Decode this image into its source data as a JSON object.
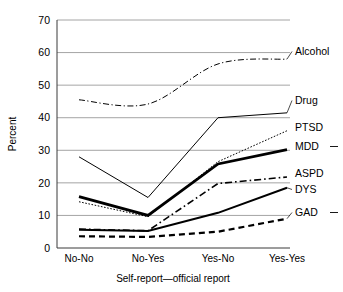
{
  "chart_data": {
    "type": "line",
    "title": "",
    "xlabel": "Self-report—official report",
    "ylabel": "Percent",
    "categories": [
      "No-No",
      "No-Yes",
      "Yes-No",
      "Yes-Yes"
    ],
    "ylim": [
      0,
      70
    ],
    "ytick_labels": [
      "0",
      "10",
      "20",
      "30",
      "40",
      "50",
      "60",
      "70"
    ],
    "yticks": [
      0,
      10,
      20,
      30,
      40,
      50,
      60,
      70
    ],
    "grid": "horizontal",
    "legend_position": "right-inline-at-line-end",
    "series": [
      {
        "name": "Alcohol",
        "values": [
          45.5,
          44.2,
          56.5,
          58.0
        ],
        "style": "dash-dot",
        "width": 1.0,
        "smooth": true
      },
      {
        "name": "Drug",
        "values": [
          28.0,
          15.5,
          40.0,
          41.5
        ],
        "style": "solid",
        "width": 1.0,
        "smooth": false
      },
      {
        "name": "PTSD",
        "values": [
          14.2,
          9.6,
          26.5,
          36.0
        ],
        "style": "dotted",
        "width": 1.0,
        "smooth": false
      },
      {
        "name": "MDD",
        "values": [
          15.8,
          10.0,
          25.8,
          30.2
        ],
        "style": "solid",
        "width": 2.8,
        "smooth": false
      },
      {
        "name": "ASPD",
        "values": [
          5.8,
          5.3,
          19.8,
          21.8
        ],
        "style": "dash-dot",
        "width": 1.6,
        "smooth": false
      },
      {
        "name": "DYS",
        "values": [
          5.6,
          5.2,
          10.8,
          18.5
        ],
        "style": "solid",
        "width": 2.0,
        "smooth": false
      },
      {
        "name": "GAD",
        "values": [
          3.6,
          3.4,
          5.0,
          9.0
        ],
        "style": "dashed",
        "width": 2.2,
        "smooth": false
      }
    ]
  },
  "legend": {
    "items": [
      {
        "label": "Alcohol"
      },
      {
        "label": "Drug"
      },
      {
        "label": "PTSD"
      },
      {
        "label": "MDD"
      },
      {
        "label": "ASPD"
      },
      {
        "label": "DYS"
      },
      {
        "label": "GAD"
      }
    ]
  },
  "colors": {
    "line": "#000000",
    "grid": "#8d8d8d",
    "axis": "#3a3a3a",
    "background": "#ffffff"
  }
}
